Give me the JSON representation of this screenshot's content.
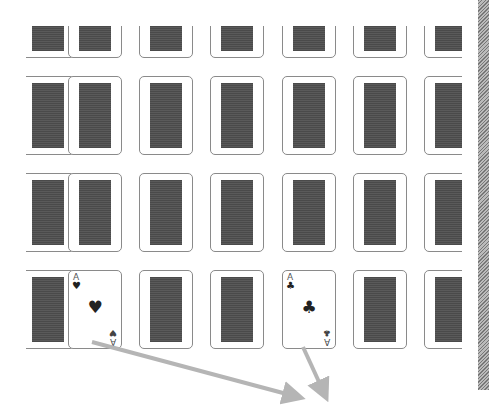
{
  "game": {
    "name": "memory-card-match",
    "grid": {
      "columns": 7,
      "rows": 4,
      "col_x": [
        -5,
        42,
        113,
        184,
        256,
        327,
        398
      ],
      "row_y": [
        -47,
        50,
        147,
        244
      ]
    },
    "face_up_cards": [
      {
        "row": 3,
        "col": 1,
        "rank": "A",
        "suit": "♥",
        "suit_name": "hearts"
      },
      {
        "row": 3,
        "col": 4,
        "rank": "A",
        "suit": "♣",
        "suit_name": "clubs"
      }
    ],
    "colors": {
      "card_back": "#4a4a4a",
      "card_border": "#8a8a8a",
      "arrow": "#b5b5b5",
      "background": "#ffffff"
    }
  },
  "annotations": {
    "arrows": [
      {
        "from": [
          92,
          342
        ],
        "to": [
          298,
          397
        ]
      },
      {
        "from": [
          303,
          347
        ],
        "to": [
          325,
          395
        ]
      }
    ]
  }
}
